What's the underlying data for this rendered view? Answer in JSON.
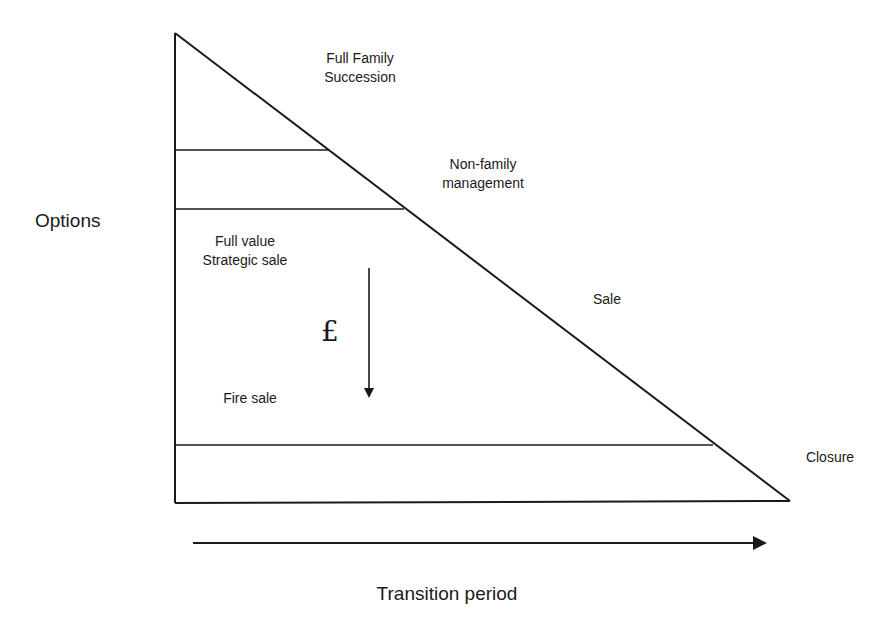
{
  "diagram": {
    "type": "triangle-options-diagram",
    "y_axis_label": "Options",
    "x_axis_label": "Transition period",
    "value_symbol": "£",
    "value_arrow_direction": "down",
    "bands": [
      {
        "name": "full-family-succession",
        "lines": [
          "Full Family",
          "Succession"
        ]
      },
      {
        "name": "non-family-management",
        "lines": [
          "Non-family",
          "management"
        ]
      },
      {
        "name": "sale",
        "lines": [
          "Sale"
        ]
      },
      {
        "name": "closure",
        "lines": [
          "Closure"
        ]
      }
    ],
    "sale_range": {
      "top_label": [
        "Full value",
        "Strategic sale"
      ],
      "bottom_label": [
        "Fire sale"
      ]
    },
    "colors": {
      "line": "#1a1a1a",
      "background": "#ffffff"
    }
  }
}
